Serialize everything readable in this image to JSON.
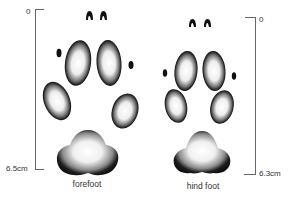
{
  "figure": {
    "colors": {
      "ink": "#111111",
      "pad_fill": "#f4f4f4",
      "scale_line": "#666666",
      "text": "#333333"
    }
  },
  "forefoot": {
    "caption": "forefoot",
    "scale": {
      "top_label": "0",
      "bottom_label": "6.5cm"
    }
  },
  "hind_foot": {
    "caption": "hind foot",
    "scale": {
      "top_label": "0",
      "bottom_label": "6.3cm"
    }
  }
}
